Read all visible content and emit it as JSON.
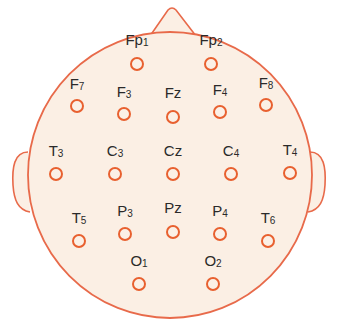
{
  "diagram": {
    "title": "",
    "type": "EEG 10-20 electrode placement (head top view)",
    "colors": {
      "outline": "#e86a4a",
      "electrode": "#e8602f",
      "fill": "#fbefe4",
      "text": "#2a2a2a"
    },
    "electrodes": [
      {
        "id": "Fp1",
        "main": "Fp",
        "sub": "1",
        "x": 137,
        "y": 64,
        "lx": 137,
        "ly": 40
      },
      {
        "id": "Fp2",
        "main": "Fp",
        "sub": "2",
        "x": 211,
        "y": 64,
        "lx": 211,
        "ly": 40
      },
      {
        "id": "F7",
        "main": "F",
        "sub": "7",
        "x": 77,
        "y": 106,
        "lx": 77,
        "ly": 84
      },
      {
        "id": "F3",
        "main": "F",
        "sub": "3",
        "x": 124,
        "y": 114,
        "lx": 124,
        "ly": 92
      },
      {
        "id": "Fz",
        "main": "Fz",
        "sub": "",
        "x": 173,
        "y": 117,
        "lx": 173,
        "ly": 93
      },
      {
        "id": "F4",
        "main": "F",
        "sub": "4",
        "x": 220,
        "y": 112,
        "lx": 220,
        "ly": 90
      },
      {
        "id": "F8",
        "main": "F",
        "sub": "8",
        "x": 266,
        "y": 105,
        "lx": 266,
        "ly": 83
      },
      {
        "id": "T3",
        "main": "T",
        "sub": "3",
        "x": 56,
        "y": 174,
        "lx": 56,
        "ly": 151
      },
      {
        "id": "C3",
        "main": "C",
        "sub": "3",
        "x": 115,
        "y": 174,
        "lx": 115,
        "ly": 151
      },
      {
        "id": "Cz",
        "main": "Cz",
        "sub": "",
        "x": 173,
        "y": 174,
        "lx": 173,
        "ly": 151
      },
      {
        "id": "C4",
        "main": "C",
        "sub": "4",
        "x": 231,
        "y": 174,
        "lx": 231,
        "ly": 151
      },
      {
        "id": "T4",
        "main": "T",
        "sub": "4",
        "x": 290,
        "y": 173,
        "lx": 290,
        "ly": 150
      },
      {
        "id": "T5",
        "main": "T",
        "sub": "5",
        "x": 79,
        "y": 241,
        "lx": 79,
        "ly": 218
      },
      {
        "id": "P3",
        "main": "P",
        "sub": "3",
        "x": 125,
        "y": 234,
        "lx": 125,
        "ly": 211
      },
      {
        "id": "Pz",
        "main": "Pz",
        "sub": "",
        "x": 173,
        "y": 232,
        "lx": 173,
        "ly": 208
      },
      {
        "id": "P4",
        "main": "P",
        "sub": "4",
        "x": 220,
        "y": 234,
        "lx": 220,
        "ly": 211
      },
      {
        "id": "T6",
        "main": "T",
        "sub": "6",
        "x": 268,
        "y": 241,
        "lx": 268,
        "ly": 218
      },
      {
        "id": "O1",
        "main": "O",
        "sub": "1",
        "x": 139,
        "y": 284,
        "lx": 139,
        "ly": 261
      },
      {
        "id": "O2",
        "main": "O",
        "sub": "2",
        "x": 213,
        "y": 284,
        "lx": 213,
        "ly": 261
      }
    ]
  }
}
